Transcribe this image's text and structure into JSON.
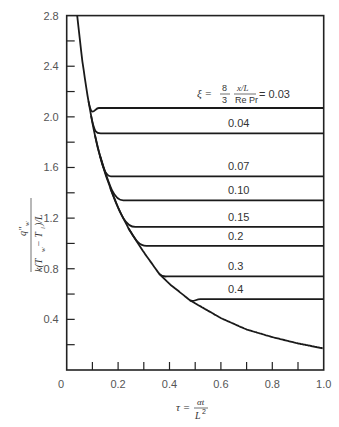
{
  "chart_data": {
    "type": "line",
    "title": "",
    "xlabel": "τ = αt / L²",
    "ylabel": "q''_w / [k(T_w − T_i)/L]",
    "xlim": [
      0,
      1.0
    ],
    "ylim": [
      0,
      2.8
    ],
    "grid": false,
    "x_ticks": [
      "0",
      "0.2",
      "0.4",
      "0.6",
      "0.8",
      "1.0"
    ],
    "y_ticks": [
      "0.4",
      "0.8",
      "1.2",
      "1.6",
      "2.0",
      "2.4",
      "2.8"
    ],
    "parameter_label": {
      "symbol": "ξ =",
      "fraction1_num": "8",
      "fraction1_den": "3",
      "fraction2_num": "x/L",
      "fraction2_den": "Re Pr",
      "equals_value": "= 0.03"
    },
    "envelope": {
      "name": "transient (ξ → ∞)",
      "x": [
        0.041,
        0.06,
        0.08,
        0.1,
        0.12,
        0.15,
        0.18,
        0.2,
        0.24,
        0.3,
        0.36,
        0.4,
        0.48,
        0.6,
        0.7,
        0.8,
        0.9,
        1.0
      ],
      "y": [
        2.8,
        2.45,
        2.18,
        1.95,
        1.76,
        1.55,
        1.38,
        1.28,
        1.12,
        0.93,
        0.76,
        0.68,
        0.55,
        0.41,
        0.32,
        0.26,
        0.21,
        0.17
      ]
    },
    "series": [
      {
        "name": "0.03",
        "xi": 0.03,
        "departs_at": 0.085,
        "steady_value": 2.07
      },
      {
        "name": "0.04",
        "xi": 0.04,
        "departs_at": 0.095,
        "steady_value": 1.87
      },
      {
        "name": "0.07",
        "xi": 0.07,
        "departs_at": 0.11,
        "steady_value": 1.53
      },
      {
        "name": "0.10",
        "xi": 0.1,
        "departs_at": 0.13,
        "steady_value": 1.34
      },
      {
        "name": "0.15",
        "xi": 0.15,
        "departs_at": 0.17,
        "steady_value": 1.13
      },
      {
        "name": "0.2",
        "xi": 0.2,
        "departs_at": 0.24,
        "steady_value": 0.98
      },
      {
        "name": "0.3",
        "xi": 0.3,
        "departs_at": 0.36,
        "steady_value": 0.74
      },
      {
        "name": "0.4",
        "xi": 0.4,
        "departs_at": 0.48,
        "steady_value": 0.56
      }
    ]
  },
  "labels": {
    "xaxis_tau": "τ =",
    "xaxis_num": "αt",
    "xaxis_den": "L",
    "xaxis_den_exp": "2",
    "yaxis_num": "q″",
    "yaxis_num_sub": "w",
    "yaxis_den": "k(T",
    "yaxis_den_rest": "w",
    "yaxis_den_tail": " − T",
    "yaxis_den_sub2": "i",
    "yaxis_den_end": ")/L",
    "origin": "0"
  }
}
